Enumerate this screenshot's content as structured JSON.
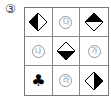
{
  "question_number": "③",
  "grid": {
    "cells": [
      {
        "type": "diamond",
        "fill": "left",
        "icon": "diamond-left-filled-icon"
      },
      {
        "type": "circled",
        "label": "다"
      },
      {
        "type": "diamond",
        "fill": "top",
        "icon": "diamond-top-filled-icon"
      },
      {
        "type": "circled",
        "label": "나"
      },
      {
        "type": "diamond",
        "fill": "bottom",
        "icon": "diamond-bottom-filled-icon"
      },
      {
        "type": "circled",
        "label": "가"
      },
      {
        "type": "club",
        "icon": "club-icon",
        "glyph": "♣"
      },
      {
        "type": "circled",
        "label": "라"
      },
      {
        "type": "diamond",
        "fill": "right",
        "icon": "diamond-right-filled-icon"
      }
    ]
  },
  "colors": {
    "fill": "#000000",
    "border": "#777777"
  }
}
